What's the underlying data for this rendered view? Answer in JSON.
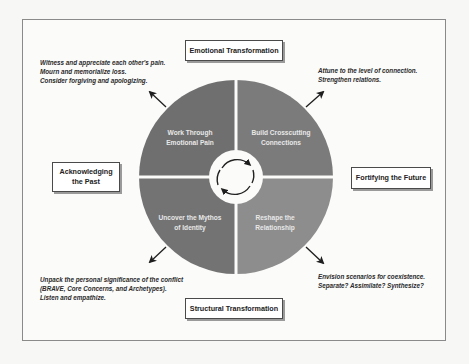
{
  "diagram": {
    "boxes": {
      "top": "Emotional Transformation",
      "bottom": "Structural Transformation",
      "left_line1": "Acknowledging",
      "left_line2": "the Past",
      "right": "Fortifying the Future"
    },
    "quadrants": {
      "top_left": {
        "line1": "Work Through",
        "line2": "Emotional Pain",
        "color": "#6f6f6f"
      },
      "top_right": {
        "line1": "Build Crosscutting",
        "line2": "Connections",
        "color": "#7b7b7b"
      },
      "bottom_left": {
        "line1": "Uncover the Mythos",
        "line2": "of Identity",
        "color": "#737373"
      },
      "bottom_right": {
        "line1": "Reshape the",
        "line2": "Relationship",
        "color": "#8d8d8d"
      }
    },
    "notes": {
      "top_left": [
        "Witness and appreciate each other's pain.",
        "Mourn and memorialize loss.",
        "Consider forgiving and apologizing."
      ],
      "top_right": [
        "Attune to the level of connection.",
        "Strengthen relations."
      ],
      "bottom_left": [
        "Unpack the personal significance of the conflict",
        "(BRAVE, Core Concerns, and Archetypes).",
        "Listen and empathize."
      ],
      "bottom_right": [
        "Envision scenarios for coexistence.",
        "Separate? Assimilate? Synthesize?"
      ]
    },
    "center_icon": "cycle-arrows-icon"
  }
}
